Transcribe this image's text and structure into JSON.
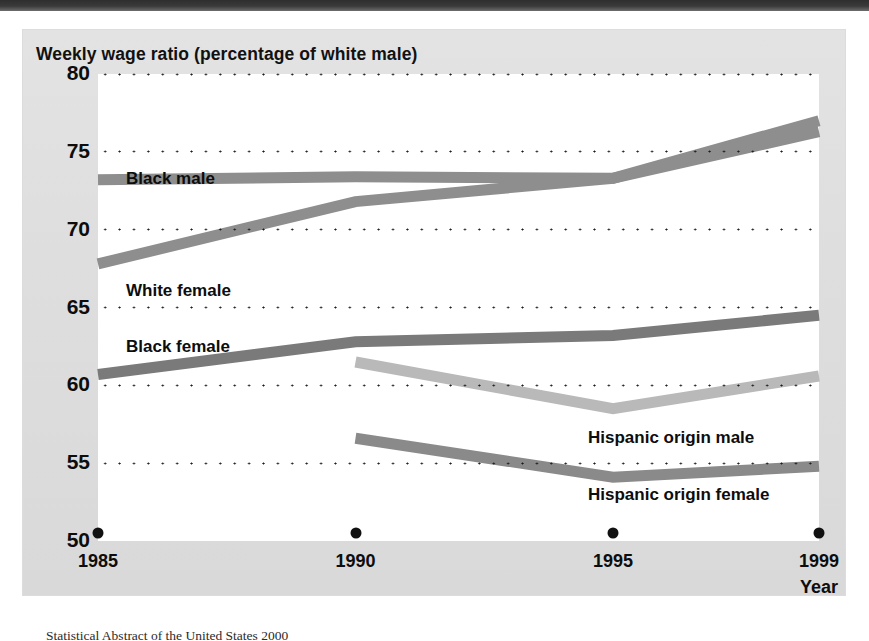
{
  "figure": {
    "title": "Weekly wage ratio (percentage of white male)",
    "caption": "Statistical Abstract of the United States 2000"
  },
  "axis": {
    "y_ticks": [
      "80",
      "75",
      "70",
      "65",
      "60",
      "55",
      "50"
    ],
    "x_ticks": [
      "1985",
      "1990",
      "1995",
      "1999"
    ],
    "x_axis_title": "Year"
  },
  "series_labels": {
    "black_male": "Black male",
    "white_female": "White female",
    "black_female": "Black female",
    "hispanic_male": "Hispanic origin male",
    "hispanic_female": "Hispanic origin female"
  },
  "colors": {
    "black_male": "#8e8e8e",
    "white_female": "#8e8e8e",
    "black_female": "#7a7a7a",
    "hispanic_male": "#b9b9b9",
    "hispanic_female": "#8a8a8a",
    "grid": "#1a1a1a",
    "panel": "#dedede",
    "plot": "#ffffff"
  },
  "chart_data": {
    "type": "line",
    "title": "Weekly wage ratio (percentage of white male)",
    "xlabel": "Year",
    "ylabel": "Weekly wage ratio (percentage of white male)",
    "x": [
      1985,
      1990,
      1995,
      1999
    ],
    "xlim": [
      1985,
      1999
    ],
    "ylim": [
      50,
      80
    ],
    "yticks": [
      50,
      55,
      60,
      65,
      70,
      75,
      80
    ],
    "xticks": [
      1985,
      1990,
      1995,
      1999
    ],
    "grid": "horizontal dotted",
    "legend": "inline labels next to each line",
    "series": [
      {
        "name": "Black male",
        "x": [
          1985,
          1990,
          1995,
          1999
        ],
        "values": [
          73.2,
          73.4,
          73.3,
          76.3
        ]
      },
      {
        "name": "White female",
        "x": [
          1985,
          1990,
          1995,
          1999
        ],
        "values": [
          67.8,
          71.8,
          73.3,
          77.0
        ]
      },
      {
        "name": "Black female",
        "x": [
          1985,
          1990,
          1995,
          1999
        ],
        "values": [
          60.7,
          62.8,
          63.2,
          64.5
        ]
      },
      {
        "name": "Hispanic origin male",
        "x": [
          1990,
          1995,
          1999
        ],
        "values": [
          61.5,
          58.5,
          60.6
        ]
      },
      {
        "name": "Hispanic origin female",
        "x": [
          1990,
          1995,
          1999
        ],
        "values": [
          56.6,
          54.1,
          54.8
        ]
      }
    ]
  }
}
